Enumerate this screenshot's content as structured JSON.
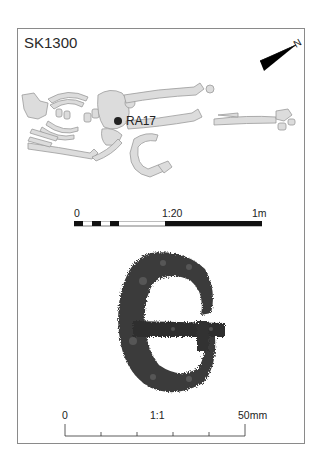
{
  "plate": {
    "skeleton_id": "SK1300",
    "find_label": "RA17",
    "north_arrow_label": "N",
    "plan_scale": {
      "ratio": "1:20",
      "start_label": "0",
      "end_label": "1m"
    },
    "object_scale": {
      "ratio": "1:1",
      "start_label": "0",
      "end_label": "50mm"
    }
  },
  "colors": {
    "bone_fill": "#dcdcdc",
    "bone_stroke": "#9a9a9a",
    "find_marker": "#222222",
    "frame": "#8a8a8a"
  }
}
